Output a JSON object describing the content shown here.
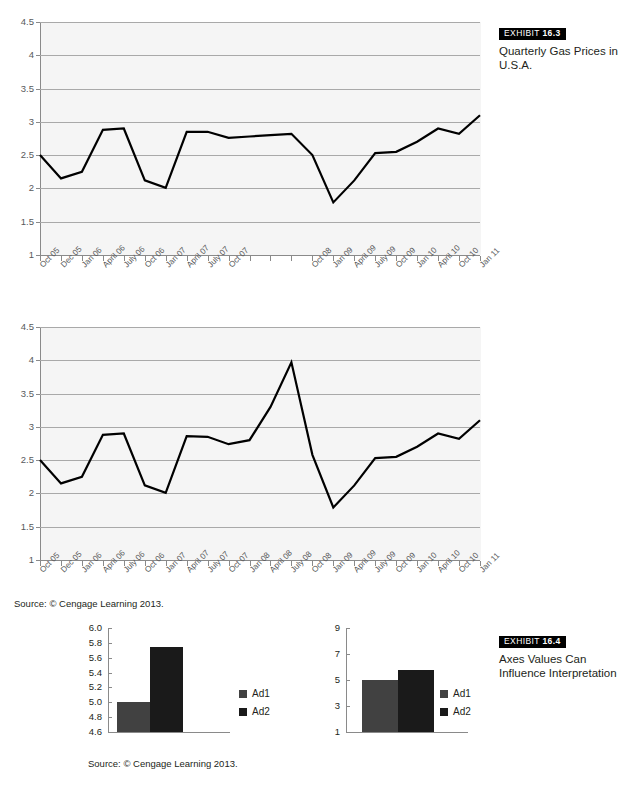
{
  "exhibit_163": {
    "badge_label": "EXHIBIT",
    "badge_number": "16.3",
    "caption": "Quarterly Gas Prices in U.S.A."
  },
  "exhibit_164": {
    "badge_label": "EXHIBIT",
    "badge_number": "16.4",
    "caption": "Axes Values Can Influence Interpretation"
  },
  "source_top": "Source: © Cengage Learning 2013.",
  "source_bottom": "Source: © Cengage Learning 2013.",
  "colors": {
    "line": "#000000",
    "plot_background": "#f5f5f5",
    "gridline": "#a9a9a9",
    "axis": "#8a8a8a",
    "tick_text": "#58595b",
    "ad1": "#414141",
    "ad2": "#1a1a1a",
    "badge_background": "#000000",
    "badge_text": "#ffffff"
  },
  "chart_data": [
    {
      "id": "gas-prices-chart-1",
      "type": "line",
      "title": "Quarterly Gas Prices in U.S.A.",
      "xlabel": "",
      "ylabel": "",
      "ylim": [
        1,
        4.5
      ],
      "yticks": [
        1,
        1.5,
        2,
        2.5,
        3,
        3.5,
        4,
        4.5
      ],
      "ytick_labels": [
        "1",
        "1.5",
        "2",
        "2.5",
        "3",
        "3.5",
        "4",
        "4.5"
      ],
      "grid": true,
      "legend": "none",
      "categories": [
        "Oct 05",
        "Dec 05",
        "Jan 06",
        "April 06",
        "July 06",
        "Oct 06",
        "Jan 07",
        "April 07",
        "July 07",
        "Oct 07",
        "Jan 08",
        "April 08",
        "July 08",
        "Oct 08",
        "Jan 09",
        "April 09",
        "July 09",
        "Oct 09",
        "Jan 10",
        "April 10",
        "Oct 10",
        "Jan 11"
      ],
      "xtick_labels": [
        "Oct 05",
        "Dec 05",
        "Jan 06",
        "April 06",
        "July 06",
        "Oct 06",
        "Jan 07",
        "April 07",
        "July 07",
        "Oct 07",
        "",
        "",
        "",
        "Oct 08",
        "Jan 09",
        "April 09",
        "July 09",
        "Oct 09",
        "Jan 10",
        "April 10",
        "Oct 10",
        "Jan 11"
      ],
      "values": [
        2.5,
        2.15,
        2.25,
        2.88,
        2.9,
        2.12,
        2.01,
        2.85,
        2.85,
        2.76,
        2.78,
        2.8,
        2.82,
        2.5,
        1.79,
        2.12,
        2.53,
        2.55,
        2.7,
        2.9,
        2.82,
        3.1
      ]
    },
    {
      "id": "gas-prices-chart-2",
      "type": "line",
      "title": "Quarterly Gas Prices in U.S.A.",
      "xlabel": "",
      "ylabel": "",
      "ylim": [
        1,
        4.5
      ],
      "yticks": [
        1,
        1.5,
        2,
        2.5,
        3,
        3.5,
        4,
        4.5
      ],
      "ytick_labels": [
        "1",
        "1.5",
        "2",
        "2.5",
        "3",
        "3.5",
        "4",
        "4.5"
      ],
      "grid": true,
      "legend": "none",
      "categories": [
        "Oct 05",
        "Dec 05",
        "Jan 06",
        "April 06",
        "July 06",
        "Oct 06",
        "Jan 07",
        "April 07",
        "July 07",
        "Oct 07",
        "Jan 08",
        "April 08",
        "July 08",
        "Oct 08",
        "Jan 09",
        "April 09",
        "July 09",
        "Oct 09",
        "Jan 10",
        "April 10",
        "Oct 10",
        "Jan 11"
      ],
      "xtick_labels": [
        "Oct 05",
        "Dec 05",
        "Jan 06",
        "April 06",
        "July 06",
        "Oct 06",
        "Jan 07",
        "April 07",
        "July 07",
        "Oct 07",
        "Jan 08",
        "April 08",
        "July 08",
        "Oct 08",
        "Jan 09",
        "April 09",
        "July 09",
        "Oct 09",
        "Jan 10",
        "April 10",
        "Oct 10",
        "Jan 11"
      ],
      "values": [
        2.5,
        2.15,
        2.25,
        2.88,
        2.9,
        2.12,
        2.01,
        2.86,
        2.85,
        2.74,
        2.8,
        3.3,
        3.97,
        2.58,
        1.79,
        2.12,
        2.53,
        2.55,
        2.7,
        2.9,
        2.82,
        3.1
      ]
    },
    {
      "id": "ad-bars-narrow-axis",
      "type": "bar",
      "title": "",
      "xlabel": "",
      "ylabel": "",
      "ylim": [
        4.6,
        6.0
      ],
      "yticks": [
        4.6,
        4.8,
        5.0,
        5.2,
        5.4,
        5.6,
        5.8,
        6.0
      ],
      "ytick_labels": [
        "4.6",
        "4.8",
        "5.0",
        "5.2",
        "5.4",
        "5.6",
        "5.8",
        "6.0"
      ],
      "grid": false,
      "legend": "right",
      "categories": [
        "Ad1",
        "Ad2"
      ],
      "values": [
        5.0,
        5.75
      ]
    },
    {
      "id": "ad-bars-wide-axis",
      "type": "bar",
      "title": "",
      "xlabel": "",
      "ylabel": "",
      "ylim": [
        1,
        9
      ],
      "yticks": [
        1,
        3,
        5,
        7,
        9
      ],
      "ytick_labels": [
        "1",
        "3",
        "5",
        "7",
        "9"
      ],
      "grid": false,
      "legend": "right",
      "categories": [
        "Ad1",
        "Ad2"
      ],
      "values": [
        5.0,
        5.75
      ]
    }
  ],
  "legend_left": [
    {
      "label": "Ad1",
      "color": "#414141"
    },
    {
      "label": "Ad2",
      "color": "#1a1a1a"
    }
  ],
  "legend_right": [
    {
      "label": "Ad1",
      "color": "#414141"
    },
    {
      "label": "Ad2",
      "color": "#1a1a1a"
    }
  ]
}
